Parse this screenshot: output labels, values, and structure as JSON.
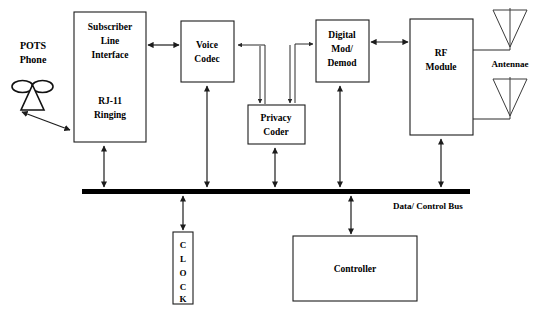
{
  "diagram": {
    "blocks": {
      "subscriber_line": {
        "name": "subscriber-line-interface-block",
        "line1": "Subscriber",
        "line2": "Line",
        "line3": "Interface",
        "line4": "RJ-11",
        "line5": "Ringing"
      },
      "voice_codec": {
        "name": "voice-codec-block",
        "line1": "Voice",
        "line2": "Codec"
      },
      "privacy_coder": {
        "name": "privacy-coder-block",
        "line1": "Privacy",
        "line2": "Coder"
      },
      "digital_mod": {
        "name": "digital-mod-demod-block",
        "line1": "Digital",
        "line2": "Mod/",
        "line3": "Demod"
      },
      "rf_module": {
        "name": "rf-module-block",
        "line1": "RF",
        "line2": "Module"
      },
      "clock": {
        "name": "clock-block",
        "letters": [
          "C",
          "L",
          "O",
          "C",
          "K"
        ],
        "label": "CLOCK"
      },
      "controller": {
        "name": "controller-block",
        "label": "Controller"
      }
    },
    "labels": {
      "pots_line1": "POTS",
      "pots_line2": "Phone",
      "antennae": "Antennae",
      "bus": "Data/ Control Bus"
    },
    "colors": {
      "stroke": "#1c1c1c",
      "bus": "#000000",
      "background": "#ffffff",
      "antenna_stroke": "#3a3a3a"
    }
  }
}
